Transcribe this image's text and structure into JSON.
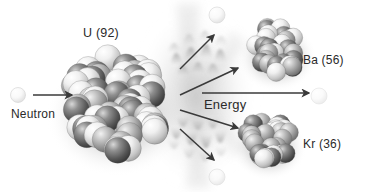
{
  "diagram": {
    "background_color": "#ffffff",
    "text_color": "#2a2a2a",
    "labels": {
      "uranium": "U (92)",
      "neutron": "Neutron",
      "barium": "Ba (56)",
      "krypton": "Kr (36)",
      "energy": "Energy"
    },
    "nuclei": [
      {
        "name": "uranium-nucleus",
        "label": "U (92)",
        "cx": 117,
        "cy": 103,
        "r": 58,
        "nucleon_count": 62,
        "nucleon_radius": 13,
        "seed": 11
      },
      {
        "name": "barium-nucleus",
        "label": "Ba (56)",
        "cx": 277,
        "cy": 50,
        "r": 33,
        "nucleon_count": 30,
        "nucleon_radius": 9.5,
        "seed": 5
      },
      {
        "name": "krypton-nucleus",
        "label": "Kr (36)",
        "cx": 269,
        "cy": 141,
        "r": 31,
        "nucleon_count": 28,
        "nucleon_radius": 9.5,
        "seed": 23
      }
    ],
    "free_neutrons": [
      {
        "name": "incoming-neutron",
        "cx": 18,
        "cy": 95,
        "r": 7.5,
        "opacity": 0.55
      },
      {
        "name": "emitted-neutron-top",
        "cx": 217,
        "cy": 15,
        "r": 8,
        "opacity": 0.5
      },
      {
        "name": "emitted-neutron-right",
        "cx": 319,
        "cy": 96,
        "r": 8,
        "opacity": 0.35
      },
      {
        "name": "emitted-neutron-bottom",
        "cx": 217,
        "cy": 177,
        "r": 8,
        "opacity": 0.4
      }
    ],
    "arrows": [
      {
        "name": "arrow-neutron-to-uranium",
        "x1": 33,
        "y1": 95,
        "x2": 72,
        "y2": 95
      },
      {
        "name": "arrow-fission-up-neutron",
        "x1": 180,
        "y1": 69,
        "x2": 214,
        "y2": 35
      },
      {
        "name": "arrow-fission-to-barium",
        "x1": 180,
        "y1": 95,
        "x2": 238,
        "y2": 68
      },
      {
        "name": "arrow-energy",
        "x1": 202,
        "y1": 93,
        "x2": 309,
        "y2": 93
      },
      {
        "name": "arrow-fission-to-krypton",
        "x1": 180,
        "y1": 110,
        "x2": 238,
        "y2": 128
      },
      {
        "name": "arrow-fission-down-neutron",
        "x1": 180,
        "y1": 129,
        "x2": 214,
        "y2": 160
      }
    ],
    "energy_burst": {
      "name": "energy-burst-waves",
      "cx": 196,
      "cy": 96,
      "description": "radiating grey scalloped wave pattern at fission point"
    }
  }
}
